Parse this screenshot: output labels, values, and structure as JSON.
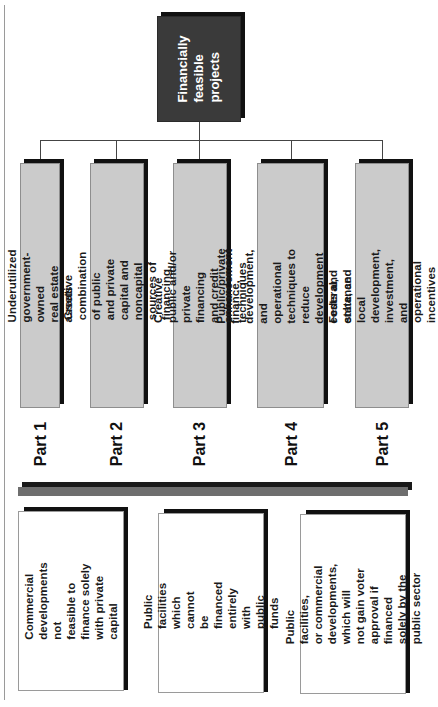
{
  "root": {
    "label": "Financially\nfeasible\nprojects"
  },
  "parts": [
    {
      "label": "Part 1",
      "technique": "Underutilized government-owned\nreal estate assets"
    },
    {
      "label": "Part 2",
      "technique": "Creative combination of public\nand private capital and noncapital\nsources of financing"
    },
    {
      "label": "Part 3",
      "technique": "Creative public and/or private\nfinancing and credit enhancement\ntechniques"
    },
    {
      "label": "Part 4",
      "technique": "Public/private finance, development,\nand operational techniques to\nreduce development costs and\nenhance cash flow"
    },
    {
      "label": "Part 5",
      "technique": "Federal, state, and local\ndevelopment, investment, and\noperational incentives"
    }
  ],
  "project_types": [
    {
      "text": "Commercial\ndevelopments not\nfeasible to finance solely\nwith private capital"
    },
    {
      "text": "Public facilities which\ncannot be financed\nentirely with public funds"
    },
    {
      "text": "Public facilities,\nor commercial\ndevelopments, which will\nnot gain voter approval if\nfinanced solely by the\npublic sector"
    }
  ],
  "colors": {
    "root_fill": "#3a3a3a",
    "technique_fill": "#cbcbcb",
    "project_fill": "#ffffff",
    "shadow": "#111111",
    "divider": "#6e6e6e"
  }
}
